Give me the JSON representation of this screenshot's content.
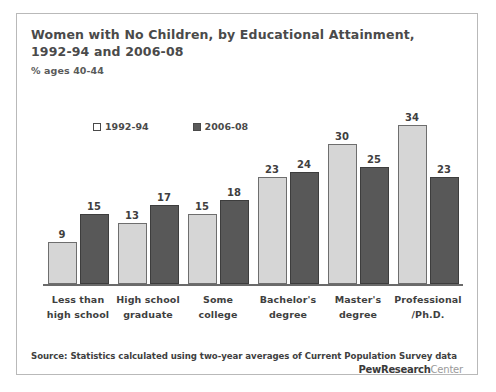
{
  "figure": {
    "title_lines": [
      "Women with No Children, by Educational Attainment,",
      "1992-94 and 2006-08"
    ],
    "subtitle": "% ages 40-44",
    "source": "Source: Statistics calculated using two-year averages of Current Population Survey data",
    "logo": {
      "bold": "PewResearch",
      "light": "Center"
    }
  },
  "chart_data": {
    "type": "bar",
    "title": "Women with No Children, by Educational Attainment, 1992-94 and 2006-08",
    "subtitle": "% ages 40-44",
    "xlabel": "",
    "ylabel": "% ages 40-44",
    "ylim": [
      0,
      36
    ],
    "grid": false,
    "legend_position": "top-left",
    "categories": [
      "Less than high school",
      "High school graduate",
      "Some college",
      "Bachelor's degree",
      "Master's degree",
      "Professional /Ph.D."
    ],
    "category_lines": [
      [
        "Less than",
        "high school"
      ],
      [
        "High school",
        "graduate"
      ],
      [
        "Some",
        "college"
      ],
      [
        "Bachelor's",
        "degree"
      ],
      [
        "Master's",
        "degree"
      ],
      [
        "Professional",
        "/Ph.D."
      ]
    ],
    "series": [
      {
        "name": "1992-94",
        "color": "#d6d6d6",
        "values": [
          9,
          13,
          15,
          23,
          30,
          34
        ]
      },
      {
        "name": "2006-08",
        "color": "#585858",
        "values": [
          15,
          17,
          18,
          24,
          25,
          23
        ]
      }
    ],
    "note": "Values are percentages of women ages 40-44 with no children."
  }
}
